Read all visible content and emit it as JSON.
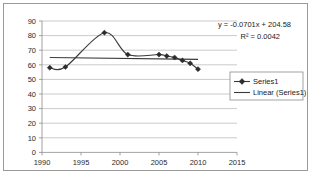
{
  "chart_data": {
    "type": "line",
    "title": "",
    "xlabel": "",
    "ylabel": "",
    "xlim": [
      1990,
      2015
    ],
    "ylim": [
      0,
      90
    ],
    "xticks": [
      "1990",
      "1995",
      "2000",
      "2005",
      "2010",
      "2015"
    ],
    "yticks": [
      "0",
      "10",
      "20",
      "30",
      "40",
      "50",
      "60",
      "70",
      "80",
      "90"
    ],
    "grid": "horizontal",
    "legend_position": "right",
    "series": [
      {
        "name": "Series1",
        "kind": "line-with-markers",
        "x": [
          1991,
          1993,
          1998,
          2001,
          2005,
          2006,
          2007,
          2008,
          2009,
          2010
        ],
        "values": [
          58,
          58.5,
          82,
          67,
          67,
          66,
          65,
          63,
          61,
          57
        ]
      },
      {
        "name": "Linear (Series1)",
        "kind": "trendline",
        "x": [
          1991,
          2010
        ],
        "values": [
          65.0,
          63.7
        ]
      }
    ],
    "annotations": {
      "equation": "y = -0.0701x + 204.58",
      "r_squared": "R² = 0.0042"
    },
    "legend": [
      {
        "label": "Series1",
        "marker": "diamond-line"
      },
      {
        "label": "Linear (Series1)",
        "marker": "line"
      }
    ],
    "colors": {
      "series": "#3a3a3a",
      "trend": "#3a3a3a",
      "grid": "#b4b4b4",
      "axis": "#8c8c8c",
      "text": "#1a1a1a",
      "background": "#ffffff"
    }
  }
}
